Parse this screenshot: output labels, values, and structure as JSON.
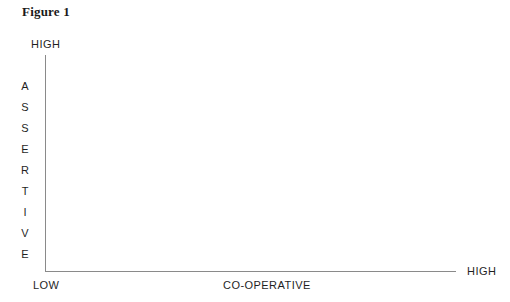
{
  "figure": {
    "title": "Figure 1",
    "background_color": "#ffffff",
    "axis_color": "#8a8a8a",
    "text_color": "#1f1f1f"
  },
  "y_axis": {
    "title": "ASSERTIVE",
    "title_letters": [
      "A",
      "S",
      "S",
      "E",
      "R",
      "T",
      "I",
      "V",
      "E"
    ],
    "high_label": "HIGH"
  },
  "x_axis": {
    "title": "CO-OPERATIVE",
    "low_label": "LOW",
    "high_label": "HIGH"
  },
  "chart_data": {
    "type": "scatter",
    "title": "Figure 1",
    "xlabel": "CO-OPERATIVE",
    "ylabel": "ASSERTIVE",
    "x": [],
    "values": [],
    "series": [],
    "xtick_labels": [
      "LOW",
      "HIGH"
    ],
    "ytick_labels": [
      "HIGH"
    ],
    "xlim": [
      0,
      1
    ],
    "ylim": [
      0,
      1
    ],
    "grid": false,
    "legend": "none",
    "annotations": []
  }
}
